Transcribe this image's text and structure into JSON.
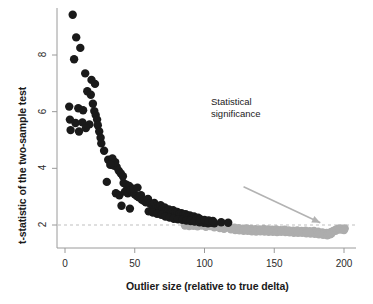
{
  "chart_data": {
    "type": "scatter",
    "title": "",
    "xlabel": "Outlier size (relative to true delta)",
    "ylabel": "t-statistic of the two-sample test",
    "xlim": [
      -6,
      206
    ],
    "ylim": [
      1.35,
      9.7
    ],
    "xticks": [
      0,
      50,
      100,
      150,
      200
    ],
    "xtick_labels": [
      "0",
      "50",
      "100",
      "150",
      "200"
    ],
    "yticks": [
      2,
      4,
      6,
      8
    ],
    "ytick_labels": [
      "2",
      "4",
      "6",
      "8"
    ],
    "grid": false,
    "legend": null,
    "annotations": [
      {
        "name": "statistical-significance",
        "text_line1": "Statistical",
        "text_line2": "significance",
        "arrow_from": [
          128,
          3.35
        ],
        "arrow_to": [
          183,
          2.08
        ],
        "color": "#b3b3b3"
      }
    ],
    "reference_lines": [
      {
        "name": "significance-threshold",
        "orientation": "horizontal",
        "value": 2,
        "style": "dashed",
        "color": "#bfbfbf"
      }
    ],
    "point_radius_px": 4.2,
    "series": [
      {
        "name": "significant",
        "color": "#1a1a1a",
        "points": [
          [
            5.5,
            9.42
          ],
          [
            8.0,
            8.62
          ],
          [
            11.0,
            8.25
          ],
          [
            6.5,
            7.85
          ],
          [
            14.5,
            7.35
          ],
          [
            19.0,
            7.12
          ],
          [
            21.5,
            6.98
          ],
          [
            16.0,
            6.72
          ],
          [
            18.5,
            6.6
          ],
          [
            3.0,
            6.18
          ],
          [
            9.5,
            6.12
          ],
          [
            13.0,
            6.05
          ],
          [
            20.0,
            6.28
          ],
          [
            21.0,
            6.02
          ],
          [
            22.0,
            5.88
          ],
          [
            23.0,
            5.72
          ],
          [
            3.5,
            5.72
          ],
          [
            7.5,
            5.6
          ],
          [
            12.5,
            5.62
          ],
          [
            17.5,
            5.55
          ],
          [
            4.0,
            5.35
          ],
          [
            10.0,
            5.3
          ],
          [
            15.0,
            5.42
          ],
          [
            23.5,
            5.52
          ],
          [
            24.5,
            5.3
          ],
          [
            25.5,
            5.08
          ],
          [
            26.0,
            4.88
          ],
          [
            28.0,
            4.62
          ],
          [
            31.0,
            4.3
          ],
          [
            33.0,
            4.18
          ],
          [
            35.0,
            4.1
          ],
          [
            37.0,
            4.05
          ],
          [
            36.0,
            4.22
          ],
          [
            34.0,
            4.35
          ],
          [
            32.5,
            4.12
          ],
          [
            38.5,
            3.92
          ],
          [
            40.0,
            3.82
          ],
          [
            41.5,
            3.72
          ],
          [
            30.0,
            3.52
          ],
          [
            42.0,
            3.48
          ],
          [
            44.0,
            3.42
          ],
          [
            46.0,
            3.38
          ],
          [
            36.5,
            3.12
          ],
          [
            39.0,
            3.05
          ],
          [
            43.0,
            3.18
          ],
          [
            45.0,
            3.12
          ],
          [
            47.0,
            3.22
          ],
          [
            48.5,
            3.15
          ],
          [
            50.0,
            3.08
          ],
          [
            51.5,
            3.02
          ],
          [
            53.0,
            2.98
          ],
          [
            54.5,
            3.05
          ],
          [
            49.0,
            3.28
          ],
          [
            52.0,
            3.32
          ],
          [
            55.0,
            2.9
          ],
          [
            56.5,
            2.85
          ],
          [
            58.0,
            2.8
          ],
          [
            59.5,
            2.92
          ],
          [
            61.0,
            2.76
          ],
          [
            62.5,
            2.7
          ],
          [
            64.0,
            2.78
          ],
          [
            65.5,
            2.66
          ],
          [
            67.0,
            2.62
          ],
          [
            68.5,
            2.7
          ],
          [
            40.5,
            2.68
          ],
          [
            46.5,
            2.58
          ],
          [
            70.0,
            2.58
          ],
          [
            71.5,
            2.62
          ],
          [
            73.0,
            2.52
          ],
          [
            74.5,
            2.55
          ],
          [
            76.0,
            2.48
          ],
          [
            77.5,
            2.52
          ],
          [
            79.0,
            2.44
          ],
          [
            80.5,
            2.46
          ],
          [
            82.0,
            2.4
          ],
          [
            83.5,
            2.42
          ],
          [
            85.0,
            2.36
          ],
          [
            86.5,
            2.38
          ],
          [
            88.0,
            2.32
          ],
          [
            89.5,
            2.34
          ],
          [
            91.0,
            2.28
          ],
          [
            92.5,
            2.3
          ],
          [
            94.0,
            2.24
          ],
          [
            95.5,
            2.26
          ],
          [
            60.0,
            2.48
          ],
          [
            63.0,
            2.44
          ],
          [
            66.0,
            2.4
          ],
          [
            69.0,
            2.36
          ],
          [
            72.0,
            2.3
          ],
          [
            75.0,
            2.26
          ],
          [
            78.0,
            2.22
          ],
          [
            81.0,
            2.2
          ],
          [
            84.0,
            2.18
          ],
          [
            87.0,
            2.16
          ],
          [
            90.0,
            2.14
          ],
          [
            93.0,
            2.12
          ],
          [
            96.5,
            2.1
          ],
          [
            98.0,
            2.14
          ],
          [
            99.5,
            2.08
          ],
          [
            101.0,
            2.12
          ],
          [
            102.5,
            2.06
          ],
          [
            104.0,
            2.1
          ],
          [
            105.5,
            2.08
          ],
          [
            107.0,
            2.06
          ],
          [
            97.0,
            2.2
          ],
          [
            100.0,
            2.18
          ],
          [
            103.0,
            2.16
          ],
          [
            106.0,
            2.14
          ],
          [
            112.0,
            2.1
          ],
          [
            117.0,
            2.08
          ]
        ]
      },
      {
        "name": "not-significant",
        "color": "#adadad",
        "points": [
          [
            86.0,
            1.98
          ],
          [
            89.0,
            1.96
          ],
          [
            92.0,
            1.97
          ],
          [
            95.0,
            1.95
          ],
          [
            98.0,
            1.98
          ],
          [
            101.0,
            1.94
          ],
          [
            104.0,
            1.96
          ],
          [
            107.0,
            1.92
          ],
          [
            110.0,
            1.95
          ],
          [
            112.5,
            1.93
          ],
          [
            115.0,
            1.9
          ],
          [
            117.5,
            1.92
          ],
          [
            120.0,
            1.88
          ],
          [
            121.5,
            1.91
          ],
          [
            123.0,
            1.86
          ],
          [
            124.5,
            1.89
          ],
          [
            126.0,
            1.84
          ],
          [
            127.5,
            1.87
          ],
          [
            129.0,
            1.85
          ],
          [
            130.5,
            1.88
          ],
          [
            132.0,
            1.83
          ],
          [
            133.5,
            1.86
          ],
          [
            135.0,
            1.82
          ],
          [
            136.5,
            1.85
          ],
          [
            138.0,
            1.8
          ],
          [
            139.5,
            1.84
          ],
          [
            141.0,
            1.82
          ],
          [
            142.5,
            1.86
          ],
          [
            144.0,
            1.81
          ],
          [
            145.5,
            1.84
          ],
          [
            147.0,
            1.79
          ],
          [
            148.5,
            1.83
          ],
          [
            150.0,
            1.8
          ],
          [
            151.5,
            1.84
          ],
          [
            153.0,
            1.78
          ],
          [
            154.5,
            1.82
          ],
          [
            156.0,
            1.8
          ],
          [
            157.5,
            1.83
          ],
          [
            159.0,
            1.78
          ],
          [
            160.5,
            1.81
          ],
          [
            162.0,
            1.76
          ],
          [
            163.5,
            1.8
          ],
          [
            165.0,
            1.77
          ],
          [
            166.5,
            1.81
          ],
          [
            168.0,
            1.75
          ],
          [
            169.5,
            1.79
          ],
          [
            171.0,
            1.76
          ],
          [
            172.5,
            1.8
          ],
          [
            174.0,
            1.74
          ],
          [
            175.5,
            1.78
          ],
          [
            177.0,
            1.75
          ],
          [
            178.5,
            1.79
          ],
          [
            180.0,
            1.73
          ],
          [
            181.5,
            1.76
          ],
          [
            183.0,
            1.71
          ],
          [
            184.5,
            1.74
          ],
          [
            186.0,
            1.68
          ],
          [
            187.5,
            1.72
          ],
          [
            189.0,
            1.7
          ],
          [
            190.5,
            1.75
          ],
          [
            192.0,
            1.78
          ],
          [
            193.5,
            1.82
          ],
          [
            195.0,
            1.85
          ],
          [
            196.5,
            1.88
          ],
          [
            198.0,
            1.86
          ],
          [
            199.5,
            1.84
          ],
          [
            200.5,
            1.88
          ],
          [
            111.0,
            1.89
          ],
          [
            114.0,
            1.87
          ],
          [
            119.0,
            1.85
          ],
          [
            122.0,
            1.82
          ],
          [
            125.0,
            1.81
          ],
          [
            128.0,
            1.8
          ],
          [
            131.0,
            1.79
          ],
          [
            134.0,
            1.78
          ],
          [
            137.0,
            1.77
          ],
          [
            140.0,
            1.78
          ],
          [
            143.0,
            1.77
          ],
          [
            146.0,
            1.76
          ],
          [
            149.0,
            1.76
          ],
          [
            152.0,
            1.75
          ],
          [
            155.0,
            1.76
          ],
          [
            158.0,
            1.75
          ],
          [
            161.0,
            1.74
          ],
          [
            164.0,
            1.73
          ],
          [
            167.0,
            1.72
          ],
          [
            170.0,
            1.72
          ],
          [
            173.0,
            1.71
          ],
          [
            176.0,
            1.7
          ],
          [
            179.0,
            1.69
          ],
          [
            182.0,
            1.67
          ],
          [
            185.0,
            1.65
          ],
          [
            188.0,
            1.64
          ],
          [
            191.0,
            1.7
          ],
          [
            194.0,
            1.79
          ],
          [
            197.0,
            1.84
          ],
          [
            200.0,
            1.82
          ],
          [
            113.0,
            1.92
          ],
          [
            118.0,
            1.9
          ],
          [
            130.0,
            1.83
          ],
          [
            145.0,
            1.8
          ],
          [
            160.0,
            1.78
          ],
          [
            175.0,
            1.73
          ],
          [
            190.0,
            1.67
          ]
        ]
      }
    ]
  }
}
